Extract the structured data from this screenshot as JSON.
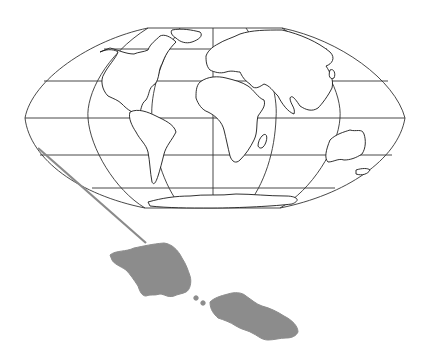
{
  "map": {
    "title": "",
    "projection": "flat-polar pseudocylindrical world map",
    "frame": {
      "outline_color": "#222222",
      "graticule_color": "#333333",
      "land_outline_color": "#1a1a1a",
      "background": "#ffffff"
    },
    "graticule": {
      "parallels_y": [
        49,
        81,
        118,
        155,
        188
      ],
      "meridians": [
        "outer-west",
        "inner-west",
        "central",
        "inner-east",
        "outer-east"
      ]
    },
    "locator": {
      "line_color": "#8a8a8a",
      "from": [
        38,
        148
      ],
      "to": [
        146,
        243
      ]
    },
    "inset": {
      "subject": "Samoa islands",
      "fill_color": "#8c8c8c",
      "islands": [
        "Savai'i",
        "Upolu"
      ],
      "small_islets": 2
    }
  }
}
